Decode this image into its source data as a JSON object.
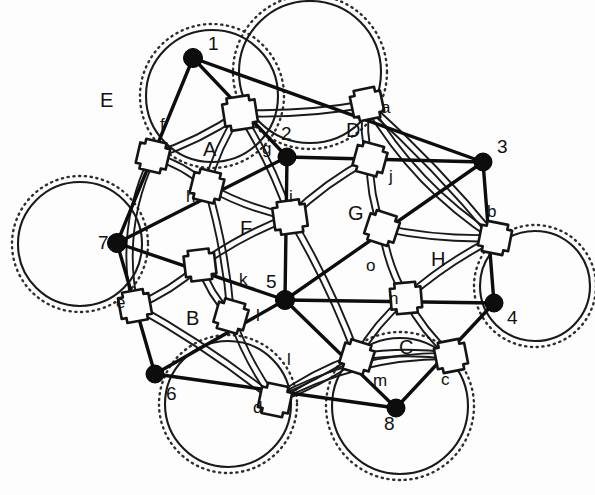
{
  "figure": {
    "background_color": "#fdfdfd",
    "ink_color": "#111111",
    "vertex_fill": "#0d0d0d",
    "loop_stroke": "#1a1a1a",
    "loop_dotted_stroke": "#2b2b2b"
  },
  "vertices": [
    {
      "id": "v1",
      "label": "1",
      "x": 193,
      "y": 58,
      "lx": 208,
      "ly": 34,
      "r": 9.5
    },
    {
      "id": "v2",
      "label": "2",
      "x": 287,
      "y": 157,
      "lx": 281,
      "ly": 124,
      "r": 9.0
    },
    {
      "id": "v3",
      "label": "3",
      "x": 483,
      "y": 162,
      "lx": 497,
      "ly": 137,
      "r": 9.0
    },
    {
      "id": "v4",
      "label": "4",
      "x": 494,
      "y": 303,
      "lx": 507,
      "ly": 308,
      "r": 9.0
    },
    {
      "id": "v5",
      "label": "5",
      "x": 285,
      "y": 300,
      "lx": 266,
      "ly": 272,
      "r": 9.5
    },
    {
      "id": "v6",
      "label": "6",
      "x": 155,
      "y": 374,
      "lx": 166,
      "ly": 384,
      "r": 9.0
    },
    {
      "id": "v7",
      "label": "7",
      "x": 117,
      "y": 243,
      "lx": 98,
      "ly": 233,
      "r": 9.5
    },
    {
      "id": "v8",
      "label": "8",
      "x": 396,
      "y": 408,
      "lx": 384,
      "ly": 414,
      "r": 9.0
    }
  ],
  "edge_nodes": [
    {
      "id": "a",
      "label": "a",
      "x": 367,
      "y": 104,
      "lx": 381,
      "ly": 99,
      "size": 15
    },
    {
      "id": "b",
      "label": "b",
      "x": 495,
      "y": 238,
      "lx": 487,
      "ly": 203,
      "size": 15
    },
    {
      "id": "c",
      "label": "c",
      "x": 451,
      "y": 356,
      "lx": 441,
      "ly": 371,
      "size": 15
    },
    {
      "id": "d",
      "label": "d",
      "x": 275,
      "y": 400,
      "lx": 253,
      "ly": 399,
      "size": 15
    },
    {
      "id": "e",
      "label": "e",
      "x": 135,
      "y": 306,
      "lx": 116,
      "ly": 294,
      "size": 15
    },
    {
      "id": "f",
      "label": "f",
      "x": 153,
      "y": 156,
      "lx": 160,
      "ly": 116,
      "size": 15
    },
    {
      "id": "g",
      "label": "g",
      "x": 240,
      "y": 113,
      "lx": 262,
      "ly": 140,
      "size": 16
    },
    {
      "id": "h",
      "label": "h",
      "x": 207,
      "y": 186,
      "lx": 186,
      "ly": 188,
      "size": 15
    },
    {
      "id": "i",
      "label": "i",
      "x": 290,
      "y": 217,
      "lx": 289,
      "ly": 188,
      "size": 16
    },
    {
      "id": "j",
      "label": "j",
      "x": 370,
      "y": 159,
      "lx": 389,
      "ly": 168,
      "size": 15
    },
    {
      "id": "k",
      "label": "k",
      "x": 200,
      "y": 265,
      "lx": 239,
      "ly": 271,
      "size": 15
    },
    {
      "id": "l1",
      "label": "l",
      "x": 231,
      "y": 316,
      "lx": 256,
      "ly": 307,
      "size": 15
    },
    {
      "id": "l2",
      "label": "l",
      "x": 357,
      "y": 357,
      "lx": 287,
      "ly": 351,
      "size": 15
    },
    {
      "id": "m",
      "label": "m",
      "x": 357,
      "y": 357,
      "lx": 373,
      "ly": 372,
      "size": 15
    },
    {
      "id": "n",
      "label": "n",
      "x": 406,
      "y": 298,
      "lx": 389,
      "ly": 290,
      "size": 15
    },
    {
      "id": "o",
      "label": "o",
      "x": 382,
      "y": 228,
      "lx": 366,
      "ly": 257,
      "size": 15
    }
  ],
  "face_labels": [
    {
      "id": "A",
      "label": "A",
      "x": 203,
      "y": 139
    },
    {
      "id": "B",
      "label": "B",
      "x": 186,
      "y": 308
    },
    {
      "id": "C",
      "label": "C",
      "x": 399,
      "y": 337
    },
    {
      "id": "D",
      "label": "D",
      "x": 346,
      "y": 120
    },
    {
      "id": "E",
      "label": "E",
      "x": 100,
      "y": 90
    },
    {
      "id": "F",
      "label": "F",
      "x": 240,
      "y": 218
    },
    {
      "id": "G",
      "label": "G",
      "x": 348,
      "y": 203
    },
    {
      "id": "H",
      "label": "H",
      "x": 431,
      "y": 249
    }
  ],
  "graph_edges": [
    {
      "from": "v1",
      "to": "v2",
      "via": "g"
    },
    {
      "from": "v1",
      "to": "v3",
      "via": "a"
    },
    {
      "from": "v1",
      "to": "v7",
      "via": "f"
    },
    {
      "from": "v2",
      "to": "v3",
      "via": "j"
    },
    {
      "from": "v2",
      "to": "v5",
      "via": "i"
    },
    {
      "from": "v2",
      "to": "v7",
      "via": "h"
    },
    {
      "from": "v3",
      "to": "v4",
      "via": "b"
    },
    {
      "from": "v3",
      "to": "v5",
      "via": "o"
    },
    {
      "from": "v4",
      "to": "v5",
      "via": "n"
    },
    {
      "from": "v4",
      "to": "v8",
      "via": "c"
    },
    {
      "from": "v5",
      "to": "v6",
      "via": "l1"
    },
    {
      "from": "v5",
      "to": "v7",
      "via": "k"
    },
    {
      "from": "v5",
      "to": "v8",
      "via": "m"
    },
    {
      "from": "v6",
      "to": "v7",
      "via": "e"
    },
    {
      "from": "v6",
      "to": "v8",
      "via": "d"
    }
  ],
  "loops": [
    {
      "at": "a",
      "cx": 310,
      "cy": 72,
      "r": 71
    },
    {
      "at": "b",
      "cx": 535,
      "cy": 286,
      "r": 55
    },
    {
      "at": "c",
      "cx": 400,
      "cy": 406,
      "r": 68
    },
    {
      "at": "d",
      "cx": 228,
      "cy": 404,
      "r": 63
    },
    {
      "at": "e",
      "cx": 80,
      "cy": 244,
      "r": 62
    },
    {
      "at": "f",
      "cx": 212,
      "cy": 96,
      "r": 66
    }
  ],
  "medial_cycles": [
    [
      "f",
      "g",
      "h"
    ],
    [
      "g",
      "a",
      "j",
      "i"
    ],
    [
      "a",
      "j",
      "o",
      "b"
    ],
    [
      "h",
      "i",
      "k",
      "l1"
    ],
    [
      "i",
      "j",
      "o",
      "n",
      "l2"
    ],
    [
      "o",
      "b",
      "n"
    ],
    [
      "k",
      "l1",
      "d",
      "e"
    ],
    [
      "l2",
      "n",
      "c",
      "m",
      "d"
    ]
  ]
}
